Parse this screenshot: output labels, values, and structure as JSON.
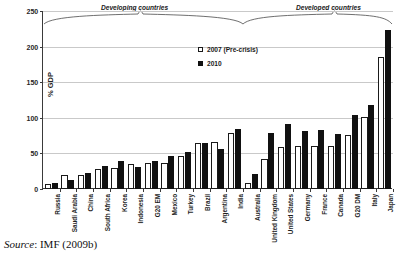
{
  "figure": {
    "source_note_keyword": "Source",
    "source_note_rest": ": IMF (2009b)"
  },
  "annotations": {
    "developing_label": "Developing countries",
    "developed_label": "Developed countries"
  },
  "legend": {
    "position": "inside-top-center",
    "items": [
      {
        "label": "2007 (Pre-crisis)",
        "swatch": "open-square",
        "color": "#ffffff"
      },
      {
        "label": "2010",
        "swatch": "solid-square",
        "color": "#111111"
      }
    ]
  },
  "chart_data": {
    "type": "bar",
    "title": "",
    "subtitle": "",
    "xlabel": "",
    "ylabel": "% GDP",
    "ylim": [
      0,
      250
    ],
    "yticks": [
      0,
      50,
      100,
      150,
      200,
      250
    ],
    "grid": true,
    "grid_axis": "y",
    "categories": [
      "Russia",
      "Saudi Arabia",
      "China",
      "South Africa",
      "Korea",
      "Indonesia",
      "G20 EM",
      "Mexico",
      "Turkey",
      "Brazil",
      "Argentina",
      "India",
      "Australia",
      "United Kingdom",
      "United States",
      "Germany",
      "France",
      "Canada",
      "G20 DM",
      "Italy",
      "Japan"
    ],
    "group_annotations": [
      {
        "label": "Developing countries",
        "from": "Russia",
        "to": "India"
      },
      {
        "label": "Developed countries",
        "from": "Australia",
        "to": "Japan"
      }
    ],
    "series": [
      {
        "name": "2007 (Pre-crisis)",
        "color": "#ffffff",
        "edge_color": "#1a1a1a",
        "values": [
          7,
          19,
          20,
          28,
          29,
          35,
          37,
          37,
          46,
          65,
          66,
          79,
          8,
          42,
          59,
          60,
          60,
          61,
          76,
          101,
          185
        ]
      },
      {
        "name": "2010",
        "color": "#111111",
        "edge_color": "#111111",
        "values": [
          8,
          13,
          22,
          33,
          39,
          31,
          39,
          47,
          52,
          64,
          56,
          84,
          21,
          79,
          91,
          82,
          83,
          77,
          104,
          118,
          224
        ]
      }
    ]
  }
}
